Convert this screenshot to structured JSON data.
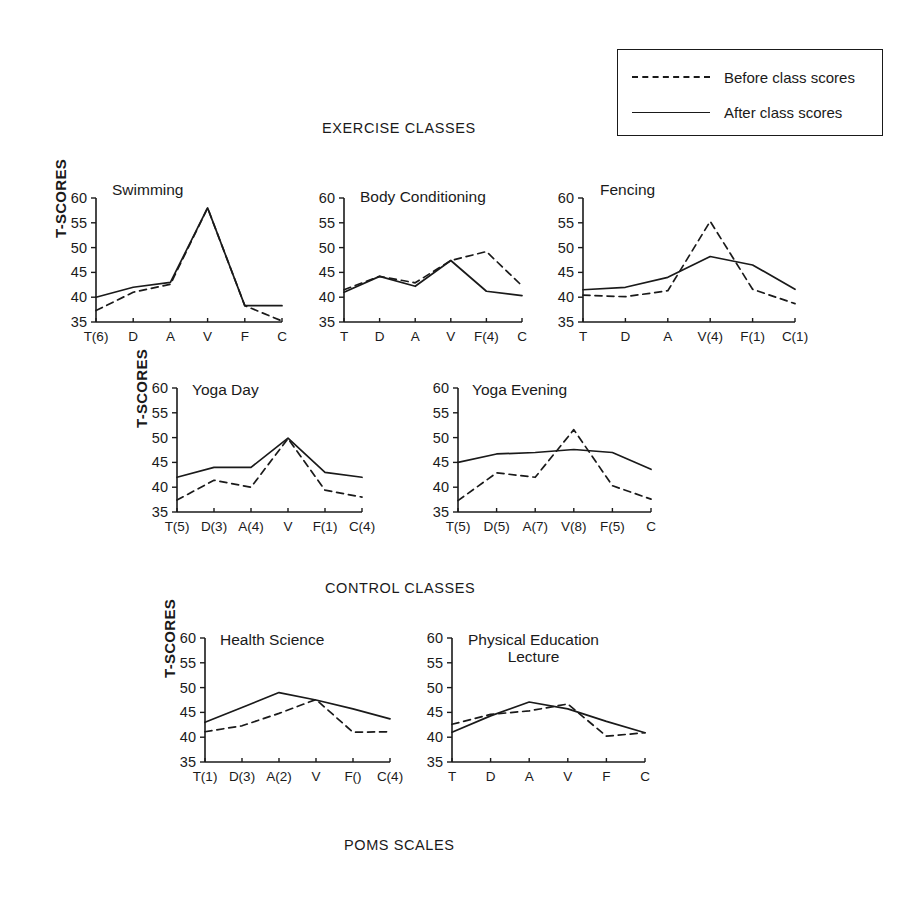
{
  "headings": {
    "exercise": "EXERCISE CLASSES",
    "control": "CONTROL CLASSES",
    "poms": "POMS SCALES"
  },
  "legend": {
    "before_label": "Before class scores",
    "after_label": "After class scores"
  },
  "axis": {
    "y_title": "T-SCORES",
    "y_ticks": [
      "60",
      "55",
      "50",
      "45",
      "40",
      "35"
    ],
    "y_min": 35,
    "y_max": 60
  },
  "chart_data": [
    {
      "type": "line",
      "title": "Swimming",
      "group": "exercise",
      "ylabel": "T-SCORES",
      "xlabel": "",
      "ylim": [
        35,
        60
      ],
      "grid": false,
      "legend_position": "top-right (shared)",
      "categories": [
        "T(6)",
        "D",
        "A",
        "V",
        "F",
        "C"
      ],
      "series": [
        {
          "name": "Before class scores",
          "style": "dashed",
          "values": [
            37.3,
            41.0,
            42.6,
            58.0,
            38.3,
            35.2
          ]
        },
        {
          "name": "After class scores",
          "style": "solid",
          "values": [
            40.0,
            42.0,
            43.0,
            58.0,
            38.3,
            38.3
          ]
        }
      ]
    },
    {
      "type": "line",
      "title": "Body Conditioning",
      "group": "exercise",
      "ylabel": "",
      "xlabel": "",
      "ylim": [
        35,
        60
      ],
      "grid": false,
      "legend_position": "top-right (shared)",
      "categories": [
        "T",
        "D",
        "A",
        "V",
        "F(4)",
        "C"
      ],
      "series": [
        {
          "name": "Before class scores",
          "style": "dashed",
          "values": [
            41.5,
            44.2,
            42.9,
            47.4,
            49.2,
            42.3
          ]
        },
        {
          "name": "After class scores",
          "style": "solid",
          "values": [
            41.0,
            44.2,
            42.2,
            47.4,
            41.2,
            40.3
          ]
        }
      ]
    },
    {
      "type": "line",
      "title": "Fencing",
      "group": "exercise",
      "ylabel": "",
      "xlabel": "",
      "ylim": [
        35,
        60
      ],
      "grid": false,
      "legend_position": "top-right (shared)",
      "categories": [
        "T",
        "D",
        "A",
        "V(4)",
        "F(1)",
        "C(1)"
      ],
      "series": [
        {
          "name": "Before class scores",
          "style": "dashed",
          "values": [
            40.4,
            40.1,
            41.3,
            55.3,
            41.6,
            38.7
          ]
        },
        {
          "name": "After class scores",
          "style": "solid",
          "values": [
            41.5,
            42.0,
            44.0,
            48.2,
            46.5,
            41.6
          ]
        }
      ]
    },
    {
      "type": "line",
      "title": "Yoga Day",
      "group": "exercise",
      "ylabel": "T-SCORES",
      "xlabel": "",
      "ylim": [
        35,
        60
      ],
      "grid": false,
      "legend_position": "top-right (shared)",
      "categories": [
        "T(5)",
        "D(3)",
        "A(4)",
        "V",
        "F(1)",
        "C(4)"
      ],
      "series": [
        {
          "name": "Before class scores",
          "style": "dashed",
          "values": [
            37.4,
            41.4,
            40.0,
            49.8,
            39.4,
            38.0
          ]
        },
        {
          "name": "After class scores",
          "style": "solid",
          "values": [
            42.0,
            44.0,
            44.0,
            49.9,
            43.0,
            42.0
          ]
        }
      ]
    },
    {
      "type": "line",
      "title": "Yoga Evening",
      "group": "exercise",
      "ylabel": "",
      "xlabel": "",
      "ylim": [
        35,
        60
      ],
      "grid": false,
      "legend_position": "top-right (shared)",
      "categories": [
        "T(5)",
        "D(5)",
        "A(7)",
        "V(8)",
        "F(5)",
        "C"
      ],
      "series": [
        {
          "name": "Before class scores",
          "style": "dashed",
          "values": [
            37.3,
            42.9,
            42.0,
            51.6,
            40.3,
            37.6
          ]
        },
        {
          "name": "After class scores",
          "style": "solid",
          "values": [
            45.0,
            46.7,
            47.0,
            47.6,
            47.0,
            43.6
          ]
        }
      ]
    },
    {
      "type": "line",
      "title": "Health Science",
      "group": "control",
      "ylabel": "T-SCORES",
      "xlabel": "",
      "ylim": [
        35,
        60
      ],
      "grid": false,
      "legend_position": "top-right (shared)",
      "categories": [
        "T(1)",
        "D(3)",
        "A(2)",
        "V",
        "F()",
        "C(4)"
      ],
      "series": [
        {
          "name": "Before class scores",
          "style": "dashed",
          "values": [
            41.1,
            42.3,
            44.8,
            47.6,
            41.0,
            41.1
          ]
        },
        {
          "name": "After class scores",
          "style": "solid",
          "values": [
            43.0,
            46.0,
            49.0,
            47.5,
            45.7,
            43.7
          ]
        }
      ]
    },
    {
      "type": "line",
      "title": "Physical Education\nLecture",
      "group": "control",
      "ylabel": "",
      "xlabel": "",
      "ylim": [
        35,
        60
      ],
      "grid": false,
      "legend_position": "top-right (shared)",
      "categories": [
        "T",
        "D",
        "A",
        "V",
        "F",
        "C"
      ],
      "series": [
        {
          "name": "Before class scores",
          "style": "dashed",
          "values": [
            42.6,
            44.6,
            45.3,
            46.7,
            40.2,
            40.9
          ]
        },
        {
          "name": "After class scores",
          "style": "solid",
          "values": [
            41.0,
            44.3,
            47.1,
            45.7,
            43.2,
            40.9
          ]
        }
      ]
    }
  ]
}
